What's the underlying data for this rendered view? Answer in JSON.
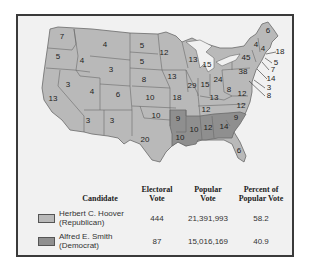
{
  "map": {
    "colors": {
      "republican": "#b9b9b9",
      "democrat": "#8f8f8f",
      "border": "#6a6a6a",
      "water": "#f1f1f1"
    },
    "states": [
      {
        "abbr": "WA",
        "votes": "7",
        "party": "R",
        "x": 62,
        "y": 37
      },
      {
        "abbr": "OR",
        "votes": "5",
        "party": "R",
        "x": 58,
        "y": 57
      },
      {
        "abbr": "CA",
        "votes": "13",
        "party": "R",
        "x": 53,
        "y": 99
      },
      {
        "abbr": "NV",
        "votes": "3",
        "party": "R",
        "x": 68,
        "y": 85
      },
      {
        "abbr": "ID",
        "votes": "4",
        "party": "R",
        "x": 82,
        "y": 61
      },
      {
        "abbr": "MT",
        "votes": "4",
        "party": "R",
        "x": 105,
        "y": 45
      },
      {
        "abbr": "WY",
        "votes": "3",
        "party": "R",
        "x": 111,
        "y": 70
      },
      {
        "abbr": "UT",
        "votes": "4",
        "party": "R",
        "x": 92,
        "y": 92
      },
      {
        "abbr": "CO",
        "votes": "6",
        "party": "R",
        "x": 118,
        "y": 95
      },
      {
        "abbr": "AZ",
        "votes": "3",
        "party": "R",
        "x": 88,
        "y": 121
      },
      {
        "abbr": "NM",
        "votes": "3",
        "party": "R",
        "x": 112,
        "y": 121
      },
      {
        "abbr": "ND",
        "votes": "5",
        "party": "R",
        "x": 142,
        "y": 46
      },
      {
        "abbr": "SD",
        "votes": "5",
        "party": "R",
        "x": 142,
        "y": 62
      },
      {
        "abbr": "NE",
        "votes": "8",
        "party": "R",
        "x": 144,
        "y": 80
      },
      {
        "abbr": "KS",
        "votes": "10",
        "party": "R",
        "x": 150,
        "y": 98
      },
      {
        "abbr": "OK",
        "votes": "10",
        "party": "R",
        "x": 156,
        "y": 116
      },
      {
        "abbr": "TX",
        "votes": "20",
        "party": "R",
        "x": 145,
        "y": 140
      },
      {
        "abbr": "MN",
        "votes": "12",
        "party": "R",
        "x": 164,
        "y": 53
      },
      {
        "abbr": "IA",
        "votes": "13",
        "party": "R",
        "x": 172,
        "y": 77
      },
      {
        "abbr": "MO",
        "votes": "18",
        "party": "R",
        "x": 177,
        "y": 98
      },
      {
        "abbr": "AR",
        "votes": "9",
        "party": "D",
        "x": 178,
        "y": 119
      },
      {
        "abbr": "LA",
        "votes": "10",
        "party": "D",
        "x": 180,
        "y": 138
      },
      {
        "abbr": "WI",
        "votes": "13",
        "party": "R",
        "x": 193,
        "y": 60
      },
      {
        "abbr": "IL",
        "votes": "29",
        "party": "R",
        "x": 192,
        "y": 86
      },
      {
        "abbr": "MI",
        "votes": "15",
        "party": "R",
        "x": 207,
        "y": 65
      },
      {
        "abbr": "IN",
        "votes": "15",
        "party": "R",
        "x": 205,
        "y": 85
      },
      {
        "abbr": "OH",
        "votes": "24",
        "party": "R",
        "x": 218,
        "y": 80
      },
      {
        "abbr": "KY",
        "votes": "13",
        "party": "R",
        "x": 214,
        "y": 98
      },
      {
        "abbr": "TN",
        "votes": "12",
        "party": "R",
        "x": 206,
        "y": 110
      },
      {
        "abbr": "MS",
        "votes": "10",
        "party": "D",
        "x": 194,
        "y": 130
      },
      {
        "abbr": "AL",
        "votes": "12",
        "party": "D",
        "x": 208,
        "y": 128
      },
      {
        "abbr": "GA",
        "votes": "14",
        "party": "D",
        "x": 224,
        "y": 127
      },
      {
        "abbr": "FL",
        "votes": "6",
        "party": "R",
        "x": 239,
        "y": 151
      },
      {
        "abbr": "SC",
        "votes": "9",
        "party": "D",
        "x": 236,
        "y": 118
      },
      {
        "abbr": "NC",
        "votes": "12",
        "party": "R",
        "x": 241,
        "y": 106
      },
      {
        "abbr": "VA",
        "votes": "12",
        "party": "R",
        "x": 242,
        "y": 94
      },
      {
        "abbr": "WV",
        "votes": "8",
        "party": "R",
        "x": 229,
        "y": 90
      },
      {
        "abbr": "PA",
        "votes": "38",
        "party": "R",
        "x": 243,
        "y": 72
      },
      {
        "abbr": "NY",
        "votes": "45",
        "party": "R",
        "x": 246,
        "y": 58
      },
      {
        "abbr": "VT",
        "votes": "4",
        "party": "R",
        "x": 256,
        "y": 45
      },
      {
        "abbr": "NH",
        "votes": "4",
        "party": "R",
        "x": 263,
        "y": 49
      },
      {
        "abbr": "ME",
        "votes": "6",
        "party": "R",
        "x": 268,
        "y": 31
      }
    ],
    "callouts": [
      {
        "abbr": "MA",
        "votes": "18",
        "x": 280,
        "y": 52,
        "tx": 266,
        "ty": 54
      },
      {
        "abbr": "RI",
        "votes": "5",
        "x": 276,
        "y": 63,
        "tx": 265,
        "ty": 58
      },
      {
        "abbr": "CT",
        "votes": "7",
        "x": 273,
        "y": 70,
        "tx": 262,
        "ty": 62
      },
      {
        "abbr": "NJ",
        "votes": "14",
        "x": 271,
        "y": 79,
        "tx": 257,
        "ty": 69
      },
      {
        "abbr": "DE",
        "votes": "3",
        "x": 269,
        "y": 88,
        "tx": 254,
        "ty": 80
      },
      {
        "abbr": "MD",
        "votes": "8",
        "x": 269,
        "y": 96,
        "tx": 249,
        "ty": 81
      }
    ]
  },
  "legend": {
    "headers": {
      "candidate": "Candidate",
      "electoral_1": "Electoral",
      "electoral_2": "Vote",
      "popular_1": "Popular",
      "popular_2": "Vote",
      "percent_1": "Percent of",
      "percent_2": "Popular Vote"
    },
    "rows": [
      {
        "name": "Herbert C. Hoover",
        "party": "(Republican)",
        "electoral": "444",
        "popular": "21,391,993",
        "percent": "58.2"
      },
      {
        "name": "Alfred E. Smith",
        "party": "(Democrat)",
        "electoral": "87",
        "popular": "15,016,169",
        "percent": "40.9"
      }
    ]
  }
}
